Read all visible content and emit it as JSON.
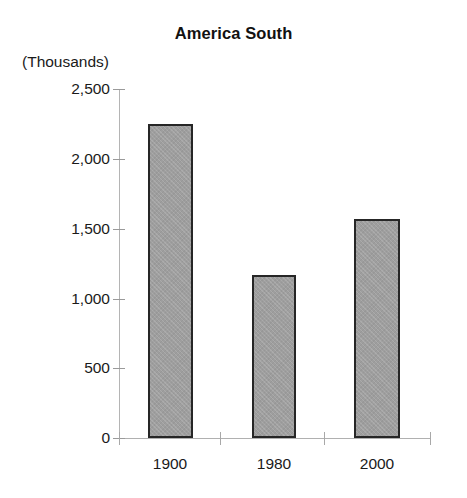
{
  "chart_data": {
    "type": "bar",
    "title": "America South",
    "xlabel": "",
    "ylabel": "(Thousands)",
    "categories": [
      "1900",
      "1980",
      "2000"
    ],
    "values": [
      2250,
      1170,
      1570
    ],
    "ylim": [
      0,
      2500
    ],
    "yticks": [
      0,
      500,
      1000,
      1500,
      2000,
      2500
    ],
    "ytick_labels": [
      "0",
      "500",
      "1,000",
      "1,500",
      "2,000",
      "2,500"
    ],
    "grid": false,
    "legend": null,
    "series": [
      {
        "name": "America South",
        "values": [
          2250,
          1170,
          1570
        ]
      }
    ],
    "bar_fill_color": "#9e9e9e",
    "bar_border_color": "#262626",
    "axis_color": "#b0b0b0",
    "background_color": "#ffffff"
  },
  "units_label": "(Thousands)"
}
